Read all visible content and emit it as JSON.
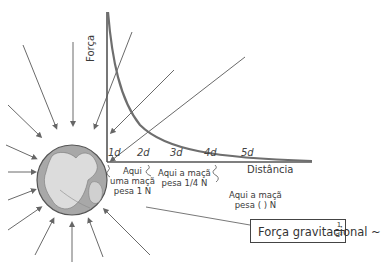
{
  "diagram": {
    "y_axis_label": "Força",
    "x_axis_label": "Distância",
    "ticks": [
      "1d",
      "2d",
      "3d",
      "4d",
      "5d"
    ],
    "annotations": [
      {
        "line1": "Aqui",
        "line2": "uma maçã",
        "line3": "pesa 1 N"
      },
      {
        "line1": "Aqui a maçã",
        "line2": "pesa 1/4 N"
      },
      {
        "line1": "Aqui a maçã",
        "line2": "pesa ( ) N"
      }
    ],
    "formula": {
      "text": "Força gravitacional ~",
      "numerator": "1",
      "denominator": "d²"
    },
    "colors": {
      "curve": "#6e6e6e",
      "axis": "#555555",
      "field_lines": "#6a6a6a",
      "earth_ocean": "#9a9a9a",
      "earth_land": "#d8d8d8"
    }
  }
}
